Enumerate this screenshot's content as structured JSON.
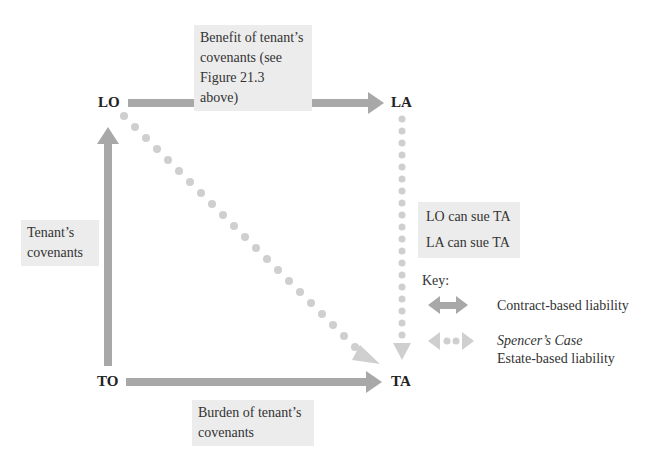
{
  "nodes": {
    "lo": "LO",
    "la": "LA",
    "to": "TO",
    "ta": "TA"
  },
  "labels": {
    "benefit": [
      "Benefit of tenant’s",
      "covenants (see",
      "Figure 21.3 above)"
    ],
    "tenants_covenants": [
      "Tenant’s",
      "covenants"
    ],
    "burden": [
      "Burden of tenant’s",
      "covenants"
    ],
    "can_sue": [
      "LO can sue TA",
      "LA can sue TA"
    ]
  },
  "key": {
    "title": "Key:",
    "contract": "Contract-based liability",
    "spencer_italic": "Spencer’s Case",
    "estate": "Estate-based liability"
  },
  "colors": {
    "solid_arrow": "#a8a8a8",
    "dotted_arrow": "#cfcfcf",
    "label_box": "#ececec"
  }
}
